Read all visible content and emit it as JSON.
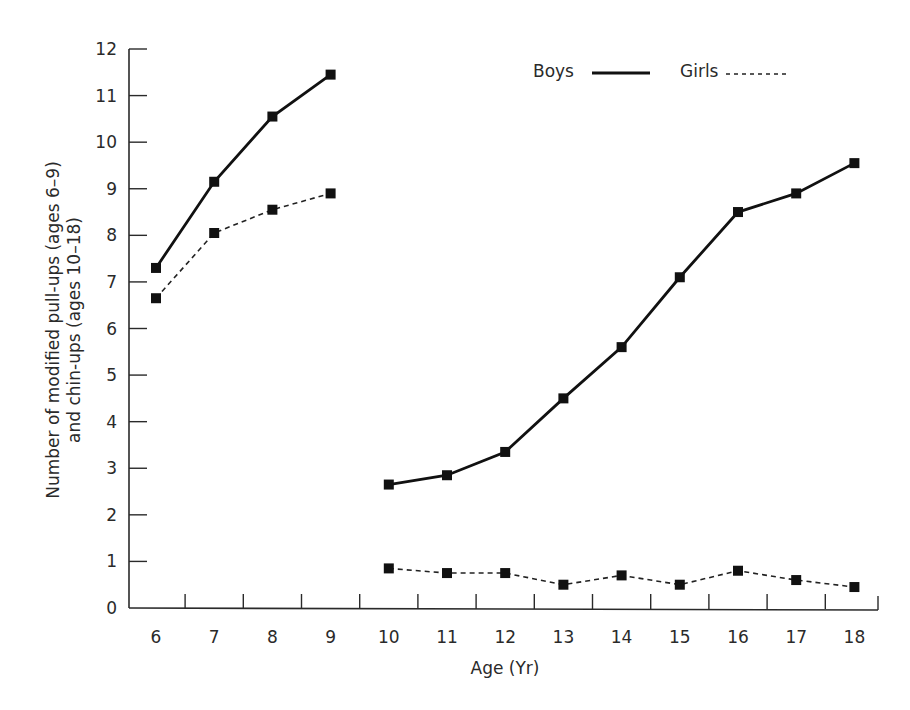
{
  "chart_data": {
    "type": "line",
    "title": "",
    "xlabel": "Age (Yr)",
    "ylabel": [
      "Number of modified pull-ups (ages 6–9)",
      "and chin-ups (ages 10–18)"
    ],
    "categories": [
      6,
      7,
      8,
      9,
      10,
      11,
      12,
      13,
      14,
      15,
      16,
      17,
      18
    ],
    "ylim": [
      0,
      12
    ],
    "yticks": [
      0,
      1,
      2,
      3,
      4,
      5,
      6,
      7,
      8,
      9,
      10,
      11,
      12
    ],
    "grid": false,
    "legend_position": "top-right",
    "segments_note": "Lines are broken between age 9 and age 10 (different tests)",
    "series": [
      {
        "name": "Boys",
        "style": "solid",
        "color": "#111111",
        "values": [
          7.3,
          9.15,
          10.55,
          11.45,
          2.65,
          2.85,
          3.35,
          4.5,
          5.6,
          7.1,
          8.5,
          8.9,
          9.55
        ]
      },
      {
        "name": "Girls",
        "style": "dashed",
        "color": "#222222",
        "values": [
          6.65,
          8.05,
          8.55,
          8.9,
          0.85,
          0.75,
          0.75,
          0.5,
          0.7,
          0.5,
          0.8,
          0.6,
          0.45
        ]
      }
    ]
  },
  "legend": {
    "boys_label": "Boys",
    "girls_label": "Girls"
  }
}
